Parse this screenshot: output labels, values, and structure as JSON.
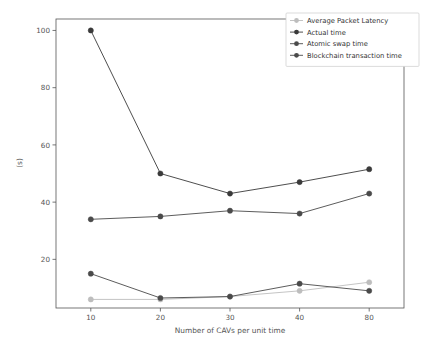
{
  "chart_data": {
    "type": "line",
    "title": "",
    "xlabel": "Number of CAVs per unit time",
    "ylabel": "(s)",
    "categories": [
      "10",
      "20",
      "30",
      "40",
      "80"
    ],
    "x_tick_labels": [
      "10",
      "20",
      "30",
      "40",
      "80"
    ],
    "y_tick_labels": [
      "20",
      "40",
      "60",
      "80",
      "100"
    ],
    "y_ticks": [
      20,
      40,
      60,
      80,
      100
    ],
    "ylim": [
      3,
      104
    ],
    "grid": false,
    "legend_position": "upper right",
    "series": [
      {
        "name": "Average Packet Latency",
        "color": "#bdbdbd",
        "marker": "o",
        "values": [
          6,
          6,
          7,
          9,
          12
        ]
      },
      {
        "name": "Actual time",
        "color": "#3a3a3a",
        "marker": "o",
        "values": [
          100,
          50,
          43,
          47,
          51.5
        ]
      },
      {
        "name": "Atomic swap time",
        "color": "#4a4a4a",
        "marker": "o",
        "values": [
          34,
          35,
          37,
          36,
          43
        ]
      },
      {
        "name": "Blockchain transaction time",
        "color": "#4a4a4a",
        "marker": "o",
        "values": [
          15,
          6.5,
          7,
          11.5,
          9
        ]
      }
    ]
  }
}
